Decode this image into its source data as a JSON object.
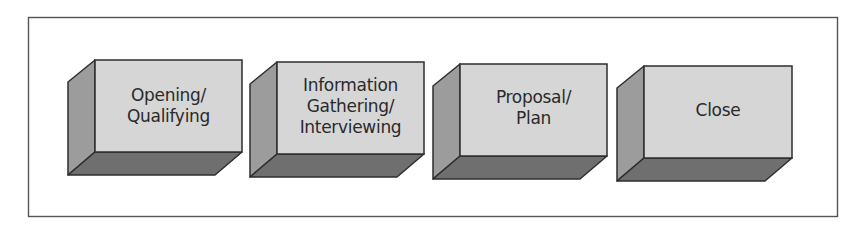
{
  "diagram": {
    "type": "process-flow",
    "frame": {
      "stroke": "#555555"
    },
    "colors": {
      "front_face": "#d6d6d6",
      "side_face": "#9c9c9c",
      "bottom_face": "#6f6f6f",
      "outline": "#2e2e2e",
      "text": "#2a2a2a"
    },
    "steps": [
      {
        "label": "Opening/\nQualifying"
      },
      {
        "label": "Information\nGathering/\nInterviewing"
      },
      {
        "label": "Proposal/\nPlan"
      },
      {
        "label": "Close"
      }
    ]
  }
}
